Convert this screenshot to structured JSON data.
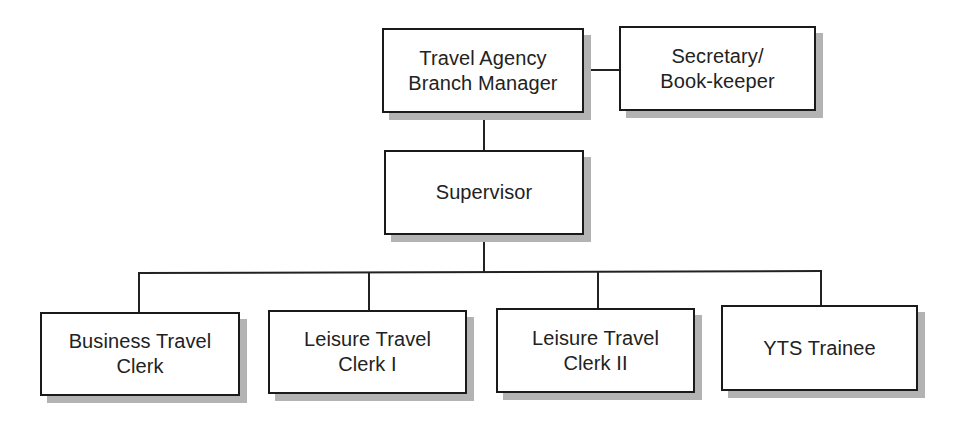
{
  "diagram": {
    "type": "org-chart",
    "nodes": [
      {
        "id": "manager",
        "label": "Travel Agency\nBranch Manager",
        "box": {
          "x": 382,
          "y": 28,
          "w": 202,
          "h": 85
        }
      },
      {
        "id": "secretary",
        "label": "Secretary/\nBook-keeper",
        "box": {
          "x": 619,
          "y": 26,
          "w": 197,
          "h": 85
        }
      },
      {
        "id": "supervisor",
        "label": "Supervisor",
        "box": {
          "x": 384,
          "y": 150,
          "w": 200,
          "h": 85
        }
      },
      {
        "id": "business-clerk",
        "label": "Business Travel\nClerk",
        "box": {
          "x": 40,
          "y": 312,
          "w": 200,
          "h": 84
        }
      },
      {
        "id": "leisure-clerk-1",
        "label": "Leisure Travel\nClerk I",
        "box": {
          "x": 268,
          "y": 310,
          "w": 199,
          "h": 84
        }
      },
      {
        "id": "leisure-clerk-2",
        "label": "Leisure Travel\nClerk II",
        "box": {
          "x": 496,
          "y": 308,
          "w": 199,
          "h": 85
        }
      },
      {
        "id": "yts-trainee",
        "label": "YTS Trainee",
        "box": {
          "x": 721,
          "y": 305,
          "w": 197,
          "h": 86
        }
      }
    ],
    "edges": [
      {
        "from": "manager",
        "to": "secretary",
        "kind": "staff"
      },
      {
        "from": "manager",
        "to": "supervisor",
        "kind": "line"
      },
      {
        "from": "supervisor",
        "to": "business-clerk",
        "kind": "line"
      },
      {
        "from": "supervisor",
        "to": "leisure-clerk-1",
        "kind": "line"
      },
      {
        "from": "supervisor",
        "to": "leisure-clerk-2",
        "kind": "line"
      },
      {
        "from": "supervisor",
        "to": "yts-trainee",
        "kind": "line"
      }
    ],
    "colors": {
      "border": "#1a1a1a",
      "shadow": "#b3b3b3",
      "text": "#222222",
      "background": "#ffffff"
    }
  }
}
